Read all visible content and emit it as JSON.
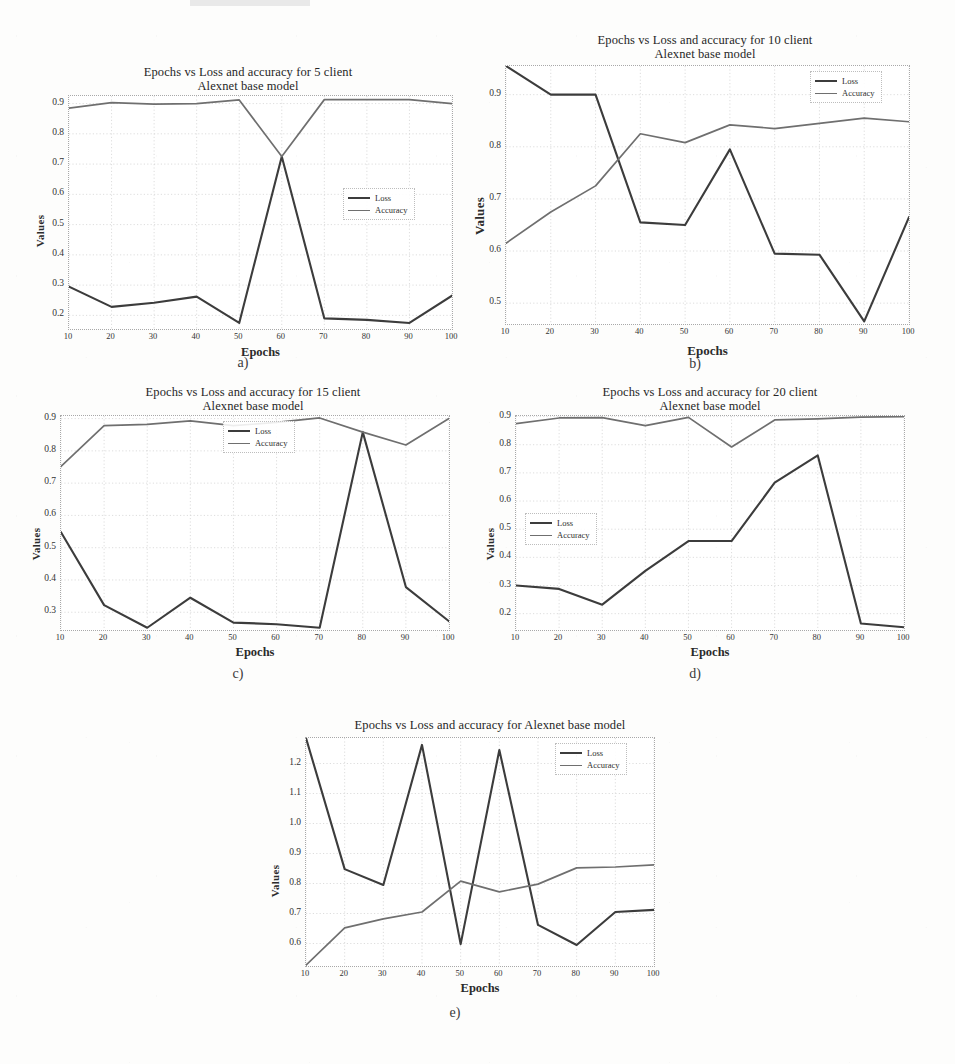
{
  "figure": {
    "ylabel": "Values",
    "xlabel": "Epochs",
    "legend": {
      "loss": "Loss",
      "accuracy": "Accuracy"
    },
    "colors": {
      "loss": "#3c3c3c",
      "accuracy": "#6f6f6f",
      "grid": "#cfcfcf",
      "frame": "#a8a8a8"
    }
  },
  "captions": {
    "a": "a)",
    "b": "b)",
    "c": "c)",
    "d": "d)",
    "e": "e)"
  },
  "chart_data": [
    {
      "id": "a",
      "type": "line",
      "title": "Epochs vs Loss and accuracy for 5 client\nAlexnet base model",
      "xlabel": "Epochs",
      "ylabel": "Values",
      "grid": true,
      "legend_position": "center-right",
      "x": [
        10,
        20,
        30,
        40,
        50,
        60,
        70,
        80,
        90,
        100
      ],
      "xticks": [
        "10",
        "20",
        "30",
        "40",
        "50",
        "60",
        "70",
        "80",
        "90",
        "100"
      ],
      "yticks": [
        "0.2",
        "0.3",
        "0.4",
        "0.5",
        "0.6",
        "0.7",
        "0.8",
        "0.9"
      ],
      "xlim": [
        10,
        100
      ],
      "ylim": [
        0.155,
        0.925
      ],
      "series": [
        {
          "name": "Loss",
          "values": [
            0.295,
            0.228,
            0.242,
            0.262,
            0.175,
            0.725,
            0.19,
            0.185,
            0.175,
            0.265
          ]
        },
        {
          "name": "Accuracy",
          "values": [
            0.885,
            0.903,
            0.898,
            0.9,
            0.912,
            0.725,
            0.913,
            0.913,
            0.913,
            0.9
          ]
        }
      ]
    },
    {
      "id": "b",
      "type": "line",
      "title": "Epochs vs Loss and accuracy for 10 client\nAlexnet base model",
      "xlabel": "Epochs",
      "ylabel": "Values",
      "grid": true,
      "legend_position": "top-right",
      "x": [
        10,
        20,
        30,
        40,
        50,
        60,
        70,
        80,
        90,
        100
      ],
      "xticks": [
        "10",
        "20",
        "30",
        "40",
        "50",
        "60",
        "70",
        "80",
        "90",
        "100"
      ],
      "yticks": [
        "0.5",
        "0.6",
        "0.7",
        "0.8",
        "0.9"
      ],
      "xlim": [
        10,
        100
      ],
      "ylim": [
        0.46,
        0.955
      ],
      "series": [
        {
          "name": "Loss",
          "values": [
            0.955,
            0.9,
            0.9,
            0.655,
            0.65,
            0.795,
            0.595,
            0.593,
            0.465,
            0.665
          ]
        },
        {
          "name": "Accuracy",
          "values": [
            0.615,
            0.675,
            0.725,
            0.825,
            0.808,
            0.842,
            0.835,
            0.845,
            0.855,
            0.848
          ]
        }
      ]
    },
    {
      "id": "c",
      "type": "line",
      "title": "Epochs vs Loss and accuracy for 15 client\nAlexnet base model",
      "xlabel": "Epochs",
      "ylabel": "Values",
      "grid": true,
      "legend_position": "top-center",
      "x": [
        10,
        20,
        30,
        40,
        50,
        60,
        70,
        80,
        90,
        100
      ],
      "xticks": [
        "10",
        "20",
        "30",
        "40",
        "50",
        "60",
        "70",
        "80",
        "90",
        "100"
      ],
      "yticks": [
        "0.3",
        "0.4",
        "0.5",
        "0.6",
        "0.7",
        "0.8",
        "0.9"
      ],
      "xlim": [
        10,
        100
      ],
      "ylim": [
        0.245,
        0.908
      ],
      "series": [
        {
          "name": "Loss",
          "values": [
            0.548,
            0.322,
            0.252,
            0.345,
            0.268,
            0.263,
            0.252,
            0.858,
            0.378,
            0.272
          ]
        },
        {
          "name": "Accuracy",
          "values": [
            0.752,
            0.878,
            0.882,
            0.893,
            0.878,
            0.888,
            0.902,
            0.858,
            0.818,
            0.9
          ]
        }
      ]
    },
    {
      "id": "d",
      "type": "line",
      "title": "Epochs vs Loss and accuracy for 20 client\nAlexnet base model",
      "xlabel": "Epochs",
      "ylabel": "Values",
      "grid": true,
      "legend_position": "center-left",
      "x": [
        10,
        20,
        30,
        40,
        50,
        60,
        70,
        80,
        90,
        100
      ],
      "xticks": [
        "10",
        "20",
        "30",
        "40",
        "50",
        "60",
        "70",
        "80",
        "90",
        "100"
      ],
      "yticks": [
        "0.2",
        "0.3",
        "0.4",
        "0.5",
        "0.6",
        "0.7",
        "0.8",
        "0.9"
      ],
      "xlim": [
        10,
        100
      ],
      "ylim": [
        0.142,
        0.902
      ],
      "series": [
        {
          "name": "Loss",
          "values": [
            0.3,
            0.288,
            0.232,
            0.352,
            0.458,
            0.458,
            0.665,
            0.762,
            0.165,
            0.152
          ]
        },
        {
          "name": "Accuracy",
          "values": [
            0.875,
            0.895,
            0.896,
            0.868,
            0.897,
            0.792,
            0.888,
            0.892,
            0.898,
            0.9
          ]
        }
      ]
    },
    {
      "id": "e",
      "type": "line",
      "title": "Epochs vs Loss and accuracy for Alexnet base model",
      "xlabel": "Epochs",
      "ylabel": "Values",
      "grid": true,
      "legend_position": "top-right",
      "x": [
        10,
        20,
        30,
        40,
        50,
        60,
        70,
        80,
        90,
        100
      ],
      "xticks": [
        "10",
        "20",
        "30",
        "40",
        "50",
        "60",
        "70",
        "80",
        "90",
        "100"
      ],
      "yticks": [
        "0.6",
        "0.7",
        "0.8",
        "0.9",
        "1.0",
        "1.1",
        "1.2"
      ],
      "xlim": [
        10,
        100
      ],
      "ylim": [
        0.525,
        1.285
      ],
      "series": [
        {
          "name": "Loss",
          "values": [
            1.285,
            0.848,
            0.795,
            1.262,
            0.598,
            1.245,
            0.662,
            0.595,
            0.705,
            0.712
          ]
        },
        {
          "name": "Accuracy",
          "values": [
            0.528,
            0.652,
            0.682,
            0.705,
            0.808,
            0.772,
            0.798,
            0.852,
            0.855,
            0.862
          ]
        }
      ]
    }
  ]
}
